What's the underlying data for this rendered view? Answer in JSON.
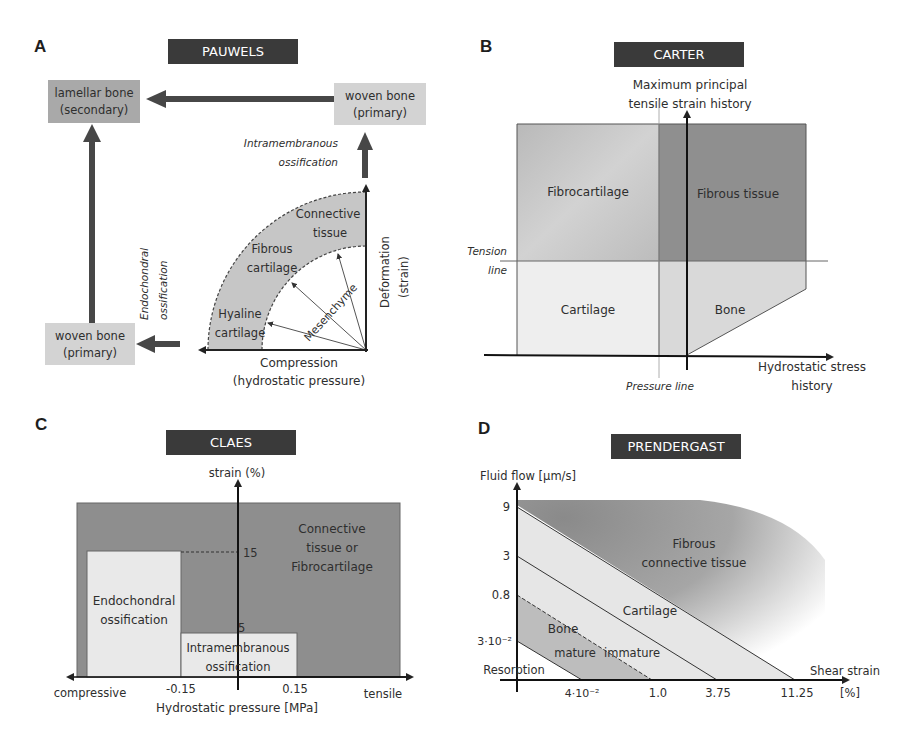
{
  "panels": {
    "A": {
      "letter": "A",
      "title": "PAUWELS",
      "boxes": {
        "lamellar_line1": "lamellar bone",
        "lamellar_line2": "(secondary)",
        "woven_top_line1": "woven bone",
        "woven_top_line2": "(primary)",
        "woven_bottom_line1": "woven bone",
        "woven_bottom_line2": "(primary)"
      },
      "labels": {
        "intramembranous_line1": "Intramembranous",
        "intramembranous_line2": "ossification",
        "endochondral_line1": "Endochondral",
        "endochondral_line2": "ossification",
        "connective_line1": "Connective",
        "connective_line2": "tissue",
        "fibrous_line1": "Fibrous",
        "fibrous_line2": "cartilage",
        "hyaline_line1": "Hyaline",
        "hyaline_line2": "cartilage",
        "mesenchyme": "Mesenchyme",
        "deformation_line1": "Deformation",
        "deformation_line2": "(strain)",
        "compression_line1": "Compression",
        "compression_line2": "(hydrostatic pressure)"
      }
    },
    "B": {
      "letter": "B",
      "title": "CARTER",
      "labels": {
        "y_axis_line1": "Maximum principal",
        "y_axis_line2": "tensile strain history",
        "x_axis_line1": "Hydrostatic stress",
        "x_axis_line2": "history",
        "tension_line1": "Tension",
        "tension_line2": "line",
        "pressure_line": "Pressure line"
      },
      "regions": {
        "fibrocartilage": "Fibrocartilage",
        "fibrous_tissue": "Fibrous tissue",
        "cartilage": "Cartilage",
        "bone": "Bone"
      }
    },
    "C": {
      "letter": "C",
      "title": "CLAES",
      "labels": {
        "y_axis": "strain (%)",
        "x_axis": "Hydrostatic pressure [MPa]",
        "x_left": "compressive",
        "x_right": "tensile",
        "tick_15": "15",
        "tick_5": "5",
        "tick_neg015": "-0.15",
        "tick_pos015": "0.15"
      },
      "regions": {
        "connective_line1": "Connective",
        "connective_line2": "tissue or",
        "connective_line3": "Fibrocartilage",
        "endochondral_line1": "Endochondral",
        "endochondral_line2": "ossification",
        "intramembranous_line1": "Intramembranous",
        "intramembranous_line2": "ossification"
      }
    },
    "D": {
      "letter": "D",
      "title": "PRENDERGAST",
      "labels": {
        "y_axis": "Fluid flow [µm/s]",
        "x_axis": "Shear strain",
        "x_unit": "[%]",
        "y_ticks": [
          "9",
          "3",
          "0.8",
          "3·10⁻²"
        ],
        "x_ticks": [
          "4·10⁻²",
          "1.0",
          "3.75",
          "11.25"
        ]
      },
      "regions": {
        "fibrous_line1": "Fibrous",
        "fibrous_line2": "connective tissue",
        "cartilage": "Cartilage",
        "bone": "Bone",
        "mature": "mature",
        "immature": "immature",
        "resorption": "Resorption"
      }
    }
  },
  "colors": {
    "title_bar": "#3a3a3a",
    "dark_region": "#8e8e8e",
    "mid_region": "#b4b4b4",
    "light_region": "#e4e4e4",
    "line": "#2a2a2a"
  }
}
